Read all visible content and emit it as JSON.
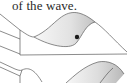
{
  "caption": {
    "text": "of the wave."
  },
  "figures": [
    {
      "id": "wave-upper",
      "description": "3D wave surface with shaded crest and a marked point",
      "marker": {
        "x": 77,
        "y": 37,
        "color": "#1a1a1a"
      }
    },
    {
      "id": "wave-lower",
      "description": "3D wave surface with shaded crest (partially visible)"
    }
  ],
  "colors": {
    "line": "#555555",
    "shade_light": "#f4f4f4",
    "shade_dark": "#bdbdbd",
    "text": "#2a2a2a"
  }
}
